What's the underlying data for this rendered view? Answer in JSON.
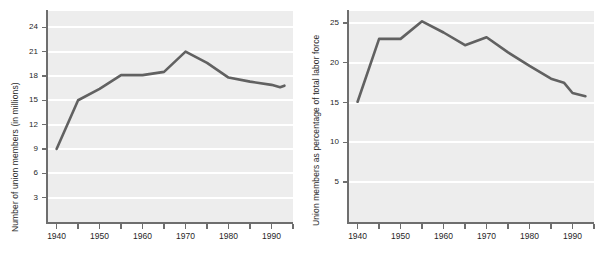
{
  "figure": {
    "panels": [
      {
        "id": "left",
        "ylabel": "Number of union members (in millions)",
        "xlabel": "",
        "y_ticks": [
          "3",
          "6",
          "9",
          "12",
          "15",
          "18",
          "21",
          "24"
        ],
        "x_ticks": [
          "1940",
          "1950",
          "1960",
          "1970",
          "1980",
          "1990"
        ]
      },
      {
        "id": "right",
        "ylabel": "Union members as percentage of total labor force",
        "xlabel": "",
        "y_ticks": [
          "5",
          "10",
          "15",
          "20",
          "25"
        ],
        "x_ticks": [
          "1940",
          "1950",
          "1960",
          "1970",
          "1980",
          "1990"
        ]
      }
    ]
  },
  "chart_data": [
    {
      "type": "line",
      "title": "",
      "subtitle": "",
      "xlabel": "",
      "ylabel": "Number of union members (in millions)",
      "x": [
        1940,
        1945,
        1950,
        1955,
        1960,
        1965,
        1970,
        1975,
        1980,
        1985,
        1990,
        1992,
        1993
      ],
      "values": [
        9.0,
        15.0,
        16.4,
        18.1,
        18.1,
        18.5,
        21.0,
        19.6,
        17.8,
        17.3,
        16.9,
        16.6,
        16.8
      ],
      "xlim": [
        1938,
        1995
      ],
      "ylim": [
        0,
        26
      ],
      "x_ticks": [
        1940,
        1950,
        1960,
        1970,
        1980,
        1990
      ],
      "x_tick_labels": [
        "1940",
        "1950",
        "1960",
        "1970",
        "1980",
        "1990"
      ],
      "x_minor_ticks": [
        1945,
        1955,
        1965,
        1975,
        1985,
        1995
      ],
      "y_ticks": [
        3,
        6,
        9,
        12,
        15,
        18,
        21,
        24
      ],
      "y_tick_labels": [
        "3",
        "6",
        "9",
        "12",
        "15",
        "18",
        "21",
        "24"
      ],
      "grid": "horizontal",
      "grid_color": "#ffffff",
      "plot_bgcolor": "#ededed",
      "line_color": "#616161",
      "legend": "none",
      "annotations": []
    },
    {
      "type": "line",
      "title": "",
      "subtitle": "",
      "xlabel": "",
      "ylabel": "Union members as percentage of total labor force",
      "x": [
        1940,
        1945,
        1950,
        1955,
        1960,
        1965,
        1970,
        1975,
        1980,
        1985,
        1988,
        1990,
        1993
      ],
      "values": [
        15.1,
        23.0,
        23.0,
        25.2,
        23.8,
        22.2,
        23.2,
        21.3,
        19.6,
        18.0,
        17.5,
        16.2,
        15.8
      ],
      "xlim": [
        1938,
        1995
      ],
      "ylim": [
        0,
        26.5
      ],
      "x_ticks": [
        1940,
        1950,
        1960,
        1970,
        1980,
        1990
      ],
      "x_tick_labels": [
        "1940",
        "1950",
        "1960",
        "1970",
        "1980",
        "1990"
      ],
      "x_minor_ticks": [
        1945,
        1955,
        1965,
        1975,
        1985,
        1995
      ],
      "y_ticks": [
        5,
        10,
        15,
        20,
        25
      ],
      "y_tick_labels": [
        "5",
        "10",
        "15",
        "20",
        "25"
      ],
      "grid": "horizontal",
      "grid_color": "#ffffff",
      "plot_bgcolor": "#ededed",
      "line_color": "#616161",
      "legend": "none",
      "annotations": []
    }
  ]
}
